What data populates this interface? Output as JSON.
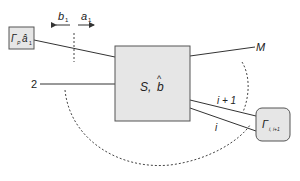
{
  "diagram": {
    "type": "multiport scattering network",
    "colors": {
      "box_fill": "#e6e6e6",
      "box_stroke": "#555555",
      "line": "#333333",
      "dashed": "#444444",
      "text": "#222222"
    },
    "central_block": {
      "label": "S, b̂",
      "label_main": "S,",
      "label_var": "b",
      "label_hat": "^"
    },
    "left_block": {
      "label_gamma": "Γ",
      "label_gamma_sub": "P",
      "label_a": "â",
      "label_a_sub": "1"
    },
    "right_block": {
      "label_gamma": "Γ",
      "label_gamma_sub": "i, i+1"
    },
    "reference_plane": {
      "left_wave": "b",
      "left_wave_sub": "1",
      "right_wave": "a",
      "right_wave_sub": "1"
    },
    "ports": [
      {
        "id": "port-1",
        "label": ""
      },
      {
        "id": "port-2",
        "label": "2"
      },
      {
        "id": "port-i",
        "label": "i"
      },
      {
        "id": "port-i-plus-1",
        "label": "i + 1"
      },
      {
        "id": "port-M",
        "label": "M"
      }
    ]
  }
}
